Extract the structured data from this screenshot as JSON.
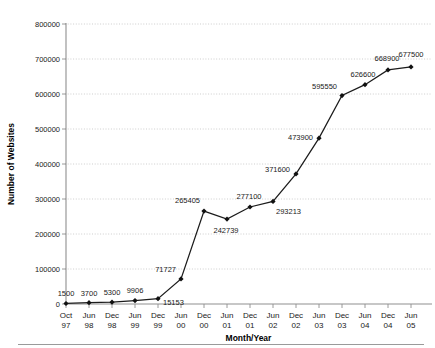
{
  "chart_data": {
    "type": "line",
    "title": "",
    "xlabel": "Month/Year",
    "ylabel": "Number of Websites",
    "ylim": [
      0,
      800000
    ],
    "ytick_values": [
      0,
      100000,
      200000,
      300000,
      400000,
      500000,
      600000,
      700000,
      800000
    ],
    "ytick_labels": [
      "0",
      "100000",
      "200000",
      "300000",
      "400000",
      "500000",
      "600000",
      "700000",
      "800000"
    ],
    "grid": true,
    "legend": null,
    "categories": [
      "Oct 97",
      "Jun 98",
      "Dec 98",
      "Jun 99",
      "Dec 99",
      "Jun 00",
      "Dec 00",
      "Jun 01",
      "Dec 01",
      "Jun 02",
      "Dec 02",
      "Jun 03",
      "Dec 03",
      "Jun 04",
      "Dec 04",
      "Jun 05"
    ],
    "xtick_month": [
      "Oct",
      "Jun",
      "Dec",
      "Jun",
      "Dec",
      "Jun",
      "Dec",
      "Jun",
      "Dec",
      "Jun",
      "Dec",
      "Jun",
      "Dec",
      "Jun",
      "Dec",
      "Jun"
    ],
    "xtick_year": [
      "97",
      "98",
      "98",
      "99",
      "99",
      "00",
      "00",
      "01",
      "01",
      "02",
      "02",
      "03",
      "03",
      "04",
      "04",
      "05"
    ],
    "values": [
      1500,
      3700,
      5300,
      9906,
      15153,
      71727,
      265405,
      242739,
      277100,
      293213,
      371600,
      473900,
      595550,
      626600,
      668900,
      677500
    ],
    "point_labels": [
      "1500",
      "3700",
      "5300",
      "9906",
      "15153",
      "71727",
      "265405",
      "242739",
      "277100",
      "293213",
      "371600",
      "473900",
      "595550",
      "626600",
      "668900",
      "677500"
    ],
    "label_offsets": [
      {
        "dx": 0,
        "dy": -7,
        "anchor": "middle"
      },
      {
        "dx": 0,
        "dy": -7,
        "anchor": "middle"
      },
      {
        "dx": 0,
        "dy": -7,
        "anchor": "middle"
      },
      {
        "dx": 0,
        "dy": -8,
        "anchor": "middle"
      },
      {
        "dx": 5,
        "dy": 6,
        "anchor": "start"
      },
      {
        "dx": -5,
        "dy": -7,
        "anchor": "end"
      },
      {
        "dx": -4,
        "dy": -8,
        "anchor": "end"
      },
      {
        "dx": -1,
        "dy": 14,
        "anchor": "middle"
      },
      {
        "dx": -1,
        "dy": -8,
        "anchor": "middle"
      },
      {
        "dx": 3,
        "dy": 13,
        "anchor": "start"
      },
      {
        "dx": -6,
        "dy": -2,
        "anchor": "end"
      },
      {
        "dx": -6,
        "dy": 2,
        "anchor": "end"
      },
      {
        "dx": -5,
        "dy": -7,
        "anchor": "end"
      },
      {
        "dx": -2,
        "dy": -8,
        "anchor": "middle"
      },
      {
        "dx": -1,
        "dy": -9,
        "anchor": "middle"
      },
      {
        "dx": 0,
        "dy": -10,
        "anchor": "middle"
      }
    ],
    "style": {
      "line_color": "#1c1c1c",
      "marker_color": "#111111",
      "marker_shape": "diamond",
      "grid_color": "#b9b9b9",
      "axis_color": "#8f8f8f",
      "background": "#ffffff"
    }
  }
}
